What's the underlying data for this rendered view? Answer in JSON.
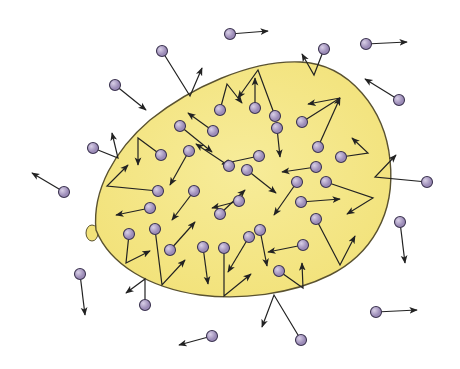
{
  "title": "Gas molecules colliding with balloon wall",
  "colors": {
    "balloon_fill": "#f2e27a",
    "balloon_fill_inner": "#f7ec9a",
    "balloon_outline": "#5a5230",
    "molecule_fill": "#9c8cb8",
    "molecule_highlight": "#d8cfe6",
    "molecule_outline": "#3c3450",
    "arrow": "#222222"
  },
  "balloon": {
    "path": "M96 230 C 92 190, 115 150, 150 120 C 190 88, 250 60, 300 62 C 350 64, 385 110, 390 160 C 396 215, 370 255, 330 275 C 290 295, 240 300, 200 295 C 150 288, 110 265, 96 230 Z",
    "knot": {
      "cx": 92,
      "cy": 233,
      "rx": 6,
      "ry": 8
    }
  },
  "molecules": [
    {
      "x": 162,
      "y": 51,
      "path": [
        [
          162,
          51
        ],
        [
          190,
          96
        ],
        [
          202,
          68
        ]
      ]
    },
    {
      "x": 115,
      "y": 85,
      "path": [
        [
          115,
          85
        ],
        [
          146,
          110
        ]
      ]
    },
    {
      "x": 93,
      "y": 148,
      "path": [
        [
          93,
          148
        ],
        [
          118,
          158
        ],
        [
          112,
          133
        ]
      ]
    },
    {
      "x": 64,
      "y": 192,
      "path": [
        [
          64,
          192
        ],
        [
          32,
          173
        ]
      ]
    },
    {
      "x": 230,
      "y": 34,
      "path": [
        [
          230,
          34
        ],
        [
          268,
          31
        ]
      ]
    },
    {
      "x": 324,
      "y": 49,
      "path": [
        [
          324,
          49
        ],
        [
          314,
          75
        ],
        [
          302,
          54
        ]
      ]
    },
    {
      "x": 366,
      "y": 44,
      "path": [
        [
          366,
          44
        ],
        [
          407,
          42
        ]
      ]
    },
    {
      "x": 399,
      "y": 100,
      "path": [
        [
          399,
          100
        ],
        [
          365,
          79
        ]
      ]
    },
    {
      "x": 427,
      "y": 182,
      "path": [
        [
          427,
          182
        ],
        [
          375,
          177
        ],
        [
          396,
          155
        ]
      ]
    },
    {
      "x": 400,
      "y": 222,
      "path": [
        [
          400,
          222
        ],
        [
          405,
          263
        ]
      ]
    },
    {
      "x": 376,
      "y": 312,
      "path": [
        [
          376,
          312
        ],
        [
          417,
          310
        ]
      ]
    },
    {
      "x": 301,
      "y": 340,
      "path": [
        [
          301,
          340
        ],
        [
          274,
          295
        ],
        [
          262,
          327
        ]
      ]
    },
    {
      "x": 212,
      "y": 336,
      "path": [
        [
          212,
          336
        ],
        [
          179,
          345
        ]
      ]
    },
    {
      "x": 145,
      "y": 305,
      "path": [
        [
          145,
          305
        ],
        [
          145,
          279
        ],
        [
          126,
          293
        ]
      ]
    },
    {
      "x": 80,
      "y": 274,
      "path": [
        [
          80,
          274
        ],
        [
          85,
          315
        ]
      ]
    },
    {
      "x": 220,
      "y": 110,
      "path": [
        [
          220,
          110
        ],
        [
          227,
          84
        ],
        [
          242,
          103
        ]
      ]
    },
    {
      "x": 255,
      "y": 108,
      "path": [
        [
          255,
          108
        ],
        [
          255,
          78
        ]
      ]
    },
    {
      "x": 275,
      "y": 116,
      "path": [
        [
          275,
          116
        ],
        [
          258,
          70
        ],
        [
          238,
          98
        ]
      ]
    },
    {
      "x": 302,
      "y": 122,
      "path": [
        [
          302,
          122
        ],
        [
          340,
          98
        ],
        [
          308,
          104
        ]
      ]
    },
    {
      "x": 318,
      "y": 147,
      "path": [
        [
          318,
          147
        ],
        [
          340,
          98
        ]
      ]
    },
    {
      "x": 341,
      "y": 157,
      "path": [
        [
          341,
          157
        ],
        [
          368,
          153
        ],
        [
          352,
          138
        ]
      ]
    },
    {
      "x": 180,
      "y": 126,
      "path": [
        [
          180,
          126
        ],
        [
          212,
          152
        ]
      ]
    },
    {
      "x": 213,
      "y": 131,
      "path": [
        [
          213,
          131
        ],
        [
          188,
          113
        ]
      ]
    },
    {
      "x": 277,
      "y": 128,
      "path": [
        [
          277,
          128
        ],
        [
          280,
          157
        ]
      ]
    },
    {
      "x": 161,
      "y": 155,
      "path": [
        [
          161,
          155
        ],
        [
          138,
          138
        ],
        [
          138,
          165
        ]
      ]
    },
    {
      "x": 189,
      "y": 151,
      "path": [
        [
          189,
          151
        ],
        [
          170,
          185
        ]
      ]
    },
    {
      "x": 259,
      "y": 156,
      "path": [
        [
          259,
          156
        ],
        [
          222,
          164
        ]
      ]
    },
    {
      "x": 316,
      "y": 167,
      "path": [
        [
          316,
          167
        ],
        [
          282,
          172
        ]
      ]
    },
    {
      "x": 229,
      "y": 166,
      "path": [
        [
          229,
          166
        ],
        [
          196,
          144
        ]
      ]
    },
    {
      "x": 247,
      "y": 170,
      "path": [
        [
          247,
          170
        ],
        [
          276,
          193
        ]
      ]
    },
    {
      "x": 297,
      "y": 182,
      "path": [
        [
          297,
          182
        ],
        [
          274,
          215
        ]
      ]
    },
    {
      "x": 326,
      "y": 182,
      "path": [
        [
          326,
          182
        ],
        [
          373,
          198
        ],
        [
          347,
          214
        ]
      ]
    },
    {
      "x": 158,
      "y": 191,
      "path": [
        [
          158,
          191
        ],
        [
          107,
          186
        ],
        [
          128,
          165
        ]
      ]
    },
    {
      "x": 194,
      "y": 191,
      "path": [
        [
          194,
          191
        ],
        [
          172,
          220
        ]
      ]
    },
    {
      "x": 239,
      "y": 201,
      "path": [
        [
          239,
          201
        ],
        [
          212,
          208
        ]
      ]
    },
    {
      "x": 301,
      "y": 202,
      "path": [
        [
          301,
          202
        ],
        [
          340,
          199
        ]
      ]
    },
    {
      "x": 150,
      "y": 208,
      "path": [
        [
          150,
          208
        ],
        [
          116,
          215
        ]
      ]
    },
    {
      "x": 316,
      "y": 219,
      "path": [
        [
          316,
          219
        ],
        [
          340,
          265
        ],
        [
          355,
          236
        ]
      ]
    },
    {
      "x": 220,
      "y": 214,
      "path": [
        [
          220,
          214
        ],
        [
          245,
          190
        ]
      ]
    },
    {
      "x": 260,
      "y": 230,
      "path": [
        [
          260,
          230
        ],
        [
          267,
          266
        ]
      ]
    },
    {
      "x": 303,
      "y": 245,
      "path": [
        [
          303,
          245
        ],
        [
          268,
          252
        ]
      ]
    },
    {
      "x": 129,
      "y": 234,
      "path": [
        [
          129,
          234
        ],
        [
          126,
          263
        ],
        [
          150,
          251
        ]
      ]
    },
    {
      "x": 155,
      "y": 229,
      "path": [
        [
          155,
          229
        ],
        [
          162,
          285
        ],
        [
          185,
          260
        ]
      ]
    },
    {
      "x": 170,
      "y": 250,
      "path": [
        [
          170,
          250
        ],
        [
          195,
          222
        ]
      ]
    },
    {
      "x": 249,
      "y": 237,
      "path": [
        [
          249,
          237
        ],
        [
          228,
          272
        ]
      ]
    },
    {
      "x": 203,
      "y": 247,
      "path": [
        [
          203,
          247
        ],
        [
          208,
          284
        ]
      ]
    },
    {
      "x": 224,
      "y": 248,
      "path": [
        [
          224,
          248
        ],
        [
          224,
          296
        ],
        [
          251,
          274
        ]
      ]
    },
    {
      "x": 279,
      "y": 271,
      "path": [
        [
          279,
          271
        ],
        [
          303,
          288
        ],
        [
          302,
          263
        ]
      ]
    }
  ]
}
